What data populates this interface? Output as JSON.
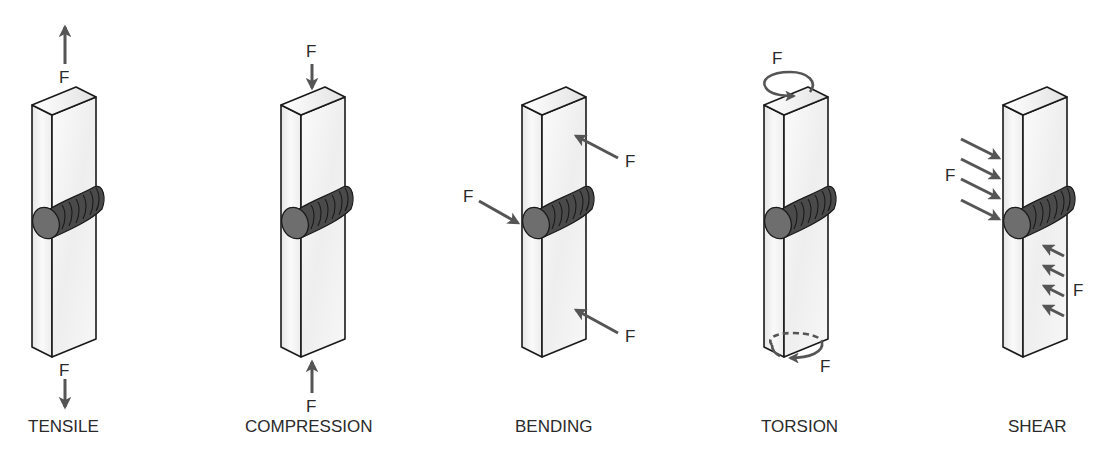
{
  "diagram": {
    "colors": {
      "bar_outline": "#1a1a1a",
      "bar_face": "#f0f0f0",
      "bar_side": "#e4e4e4",
      "weld": "#4a4a4a",
      "weld_cap": "#6e6e6e",
      "arrow": "#555555",
      "text": "#2a2a2a"
    },
    "force_label": "F",
    "panels": [
      {
        "id": "tensile",
        "label": "TENSILE",
        "forces": [
          "F",
          "F"
        ]
      },
      {
        "id": "compression",
        "label": "COMPRESSION",
        "forces": [
          "F",
          "F"
        ]
      },
      {
        "id": "bending",
        "label": "BENDING",
        "forces": [
          "F",
          "F",
          "F"
        ]
      },
      {
        "id": "torsion",
        "label": "TORSION",
        "forces": [
          "F",
          "F"
        ]
      },
      {
        "id": "shear",
        "label": "SHEAR",
        "forces": [
          "F",
          "F"
        ]
      }
    ]
  }
}
